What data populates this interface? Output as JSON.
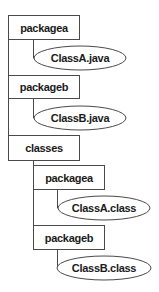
{
  "diagram": {
    "type": "directory-tree",
    "nodes": [
      {
        "id": "packagea_src",
        "kind": "folder",
        "label": "packagea"
      },
      {
        "id": "classa_java",
        "kind": "file",
        "label": "ClassA.java",
        "parent": "packagea_src"
      },
      {
        "id": "packageb_src",
        "kind": "folder",
        "label": "packageb"
      },
      {
        "id": "classb_java",
        "kind": "file",
        "label": "ClassB.java",
        "parent": "packageb_src"
      },
      {
        "id": "classes",
        "kind": "folder",
        "label": "classes"
      },
      {
        "id": "packagea_cls",
        "kind": "folder",
        "label": "packagea",
        "parent": "classes"
      },
      {
        "id": "classa_class",
        "kind": "file",
        "label": "ClassA.class",
        "parent": "packagea_cls"
      },
      {
        "id": "packageb_cls",
        "kind": "folder",
        "label": "packageb",
        "parent": "classes"
      },
      {
        "id": "classb_class",
        "kind": "file",
        "label": "ClassB.class",
        "parent": "packageb_cls"
      }
    ],
    "colors": {
      "stroke": "#4a4a4a",
      "fill": "#ffffff",
      "text": "#1a1a1a"
    }
  }
}
